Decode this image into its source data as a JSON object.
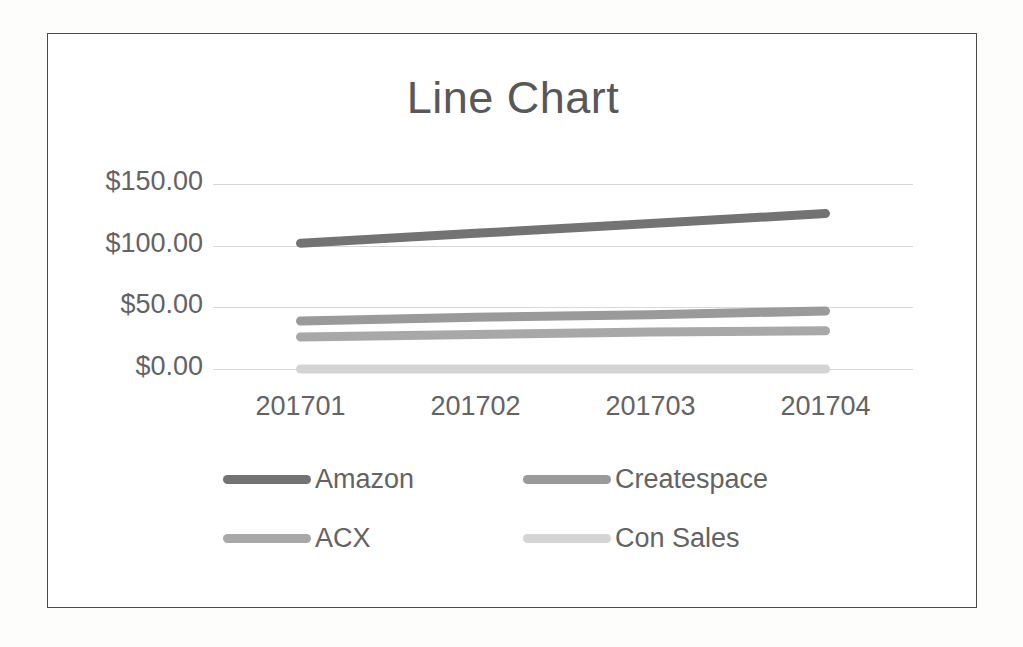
{
  "chart_data": {
    "type": "line",
    "title": "Line Chart",
    "xlabel": "",
    "ylabel": "",
    "categories": [
      "201701",
      "201702",
      "201703",
      "201704"
    ],
    "x": [
      "201701",
      "201702",
      "201703",
      "201704"
    ],
    "ylim": [
      0,
      150
    ],
    "yticks": [
      0,
      50,
      100,
      150
    ],
    "ytick_labels": [
      "$0.00",
      "$50.00",
      "$100.00",
      "$150.00"
    ],
    "grid": "horizontal",
    "legend_position": "bottom",
    "series": [
      {
        "name": "Amazon",
        "values": [
          102,
          110,
          118,
          126
        ],
        "color": "#737373"
      },
      {
        "name": "Createspace",
        "values": [
          39,
          42,
          44,
          47
        ],
        "color": "#9a9a9a"
      },
      {
        "name": "ACX",
        "values": [
          26,
          28,
          30,
          31
        ],
        "color": "#a8a8a8"
      },
      {
        "name": "Con Sales",
        "values": [
          0,
          0,
          0,
          0
        ],
        "color": "#d4d4d4"
      }
    ]
  },
  "legend": {
    "items": [
      {
        "label": "Amazon"
      },
      {
        "label": "Createspace"
      },
      {
        "label": "ACX"
      },
      {
        "label": "Con Sales"
      }
    ]
  },
  "colors": {
    "frame_border": "#4a4a4a",
    "gridline": "#d8d8d8",
    "axis_text": "#636363",
    "title_text": "#585858",
    "background": "#ffffff"
  }
}
